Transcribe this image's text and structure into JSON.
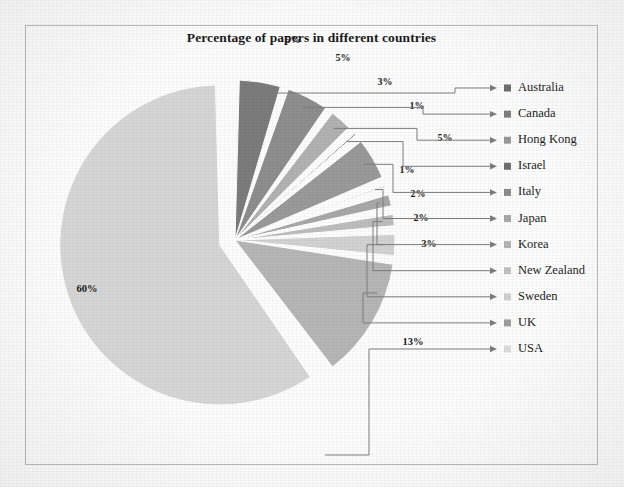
{
  "chart_data": {
    "type": "pie",
    "title": "Percentage of papers in different countries",
    "xlabel": "",
    "ylabel": "",
    "legend_position": "right",
    "grid": false,
    "exploded_slice": "USA",
    "categories": [
      "Australia",
      "Canada",
      "Hong Kong",
      "Israel",
      "Italy",
      "Japan",
      "Korea",
      "New Zealand",
      "Sweden",
      "UK",
      "USA"
    ],
    "values": [
      5,
      5,
      3,
      1,
      5,
      1,
      2,
      2,
      3,
      13,
      60
    ],
    "value_labels": [
      "5%",
      "5%",
      "3%",
      "1%",
      "5%",
      "1%",
      "2%",
      "2%",
      "3%",
      "13%",
      "60%"
    ],
    "slice_colors": [
      "#7c7c7c",
      "#8e8e8e",
      "#b2b2b2",
      "#6f6f6f",
      "#9a9a9a",
      "#c4c4c4",
      "#a8a8a8",
      "#bdbdbd",
      "#d2d2d2",
      "#b6b6b6",
      "#d6d6d6"
    ],
    "legend_swatch_colors": [
      "#6e6e6e",
      "#7f7f7f",
      "#9a9a9a",
      "#707070",
      "#8d8d8d",
      "#a9a9a9",
      "#b4b4b4",
      "#c2c2c2",
      "#d0d0d0",
      "#9f9f9f",
      "#dcdcdc"
    ]
  },
  "chart": {
    "title": "Percentage of papers in different countries",
    "slices": [
      {
        "label": "Australia",
        "percent_label": "5%",
        "value": 5,
        "color": "#7c7c7c"
      },
      {
        "label": "Canada",
        "percent_label": "5%",
        "value": 5,
        "color": "#8e8e8e"
      },
      {
        "label": "Hong Kong",
        "percent_label": "3%",
        "value": 3,
        "color": "#b2b2b2"
      },
      {
        "label": "Israel",
        "percent_label": "1%",
        "value": 1,
        "color": "#6f6f6f"
      },
      {
        "label": "Italy",
        "percent_label": "5%",
        "value": 5,
        "color": "#9a9a9a"
      },
      {
        "label": "Japan",
        "percent_label": "1%",
        "value": 1,
        "color": "#c4c4c4"
      },
      {
        "label": "Korea",
        "percent_label": "2%",
        "value": 2,
        "color": "#a8a8a8"
      },
      {
        "label": "New Zealand",
        "percent_label": "2%",
        "value": 2,
        "color": "#bdbdbd"
      },
      {
        "label": "Sweden",
        "percent_label": "3%",
        "value": 3,
        "color": "#d2d2d2"
      },
      {
        "label": "UK",
        "percent_label": "13%",
        "value": 13,
        "color": "#b6b6b6"
      },
      {
        "label": "USA",
        "percent_label": "60%",
        "value": 60,
        "color": "#d6d6d6"
      }
    ],
    "legend": [
      {
        "label": "Australia",
        "swatch": "#6e6e6e"
      },
      {
        "label": "Canada",
        "swatch": "#7f7f7f"
      },
      {
        "label": "Hong Kong",
        "swatch": "#9a9a9a"
      },
      {
        "label": "Israel",
        "swatch": "#707070"
      },
      {
        "label": "Italy",
        "swatch": "#8d8d8d"
      },
      {
        "label": "Japan",
        "swatch": "#a9a9a9"
      },
      {
        "label": "Korea",
        "swatch": "#b4b4b4"
      },
      {
        "label": "New Zealand",
        "swatch": "#c2c2c2"
      },
      {
        "label": "Sweden",
        "swatch": "#d0d0d0"
      },
      {
        "label": "UK",
        "swatch": "#9f9f9f"
      },
      {
        "label": "USA",
        "swatch": "#dcdcdc"
      }
    ]
  }
}
